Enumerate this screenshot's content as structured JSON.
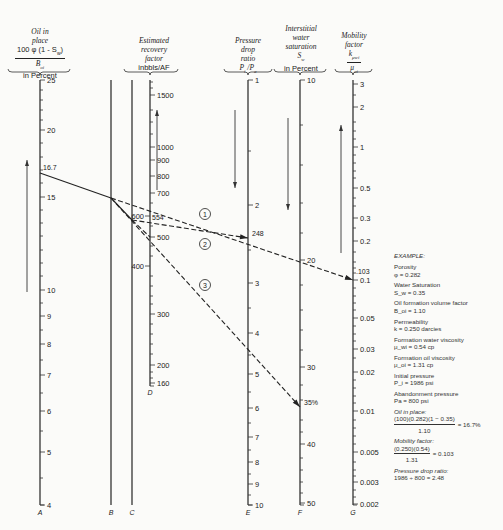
{
  "headers": {
    "A": {
      "lines": [
        "Oil in",
        "place"
      ],
      "numerator": "100 φ (1 - S_w)",
      "denominator": "B_oi",
      "unit": "in Percent"
    },
    "D": {
      "lines": [
        "Estimated",
        "recovery",
        "factor"
      ],
      "unit": "inbbls/AF"
    },
    "E": {
      "lines": [
        "Pressure",
        "drop",
        "ratio"
      ],
      "symbol": "P_i / P_a"
    },
    "F": {
      "lines": [
        "Interstitial",
        "water",
        "saturation"
      ],
      "symbol": "S_w",
      "unit": "in Percent"
    },
    "G": {
      "lines": [
        "Mobility",
        "factor"
      ],
      "numerator": "k_μwi",
      "denominator": "μ_oi"
    }
  },
  "example": {
    "title": "EXAMPLE:",
    "items": [
      {
        "label": "Porosity",
        "value": "φ = 0.282"
      },
      {
        "label": "Water Saturation",
        "value": "S_w = 0.35"
      },
      {
        "label": "Oil formation volume factor",
        "value": "B_oi = 1.10"
      },
      {
        "label": "Permeability",
        "value": "k = 0.250 darcies"
      },
      {
        "label": "Formation water viscosity",
        "value": "μ_wi = 0.54 cp"
      },
      {
        "label": "Formation oil viscosity",
        "value": "μ_oi = 1.31 cp"
      },
      {
        "label": "Initial pressure",
        "value": "P_i = 1986 psi"
      },
      {
        "label": "Abandonment pressure",
        "value": "Pa = 800 psi"
      }
    ],
    "oil_in_place": {
      "label": "Oil in place:",
      "numerator": "(100)(0.282)(1 − 0.35)",
      "denominator": "1.10",
      "result": "= 16.7%"
    },
    "mobility": {
      "label": "Mobility factor:",
      "numerator": "(0.250)(0.54)",
      "denominator": "1.31",
      "result": "= 0.103"
    },
    "pressure": {
      "label": "Pressure drop ratio:",
      "value": "1986 ÷ 800 = 2.48"
    }
  },
  "chart_data": {
    "type": "nomograph",
    "axes": [
      {
        "id": "A",
        "name": "Oil in place, 100φ(1-Sw)/Boi, in Percent",
        "x": 40,
        "y_top": 80,
        "y_bottom": 505,
        "ticks": [
          {
            "label": "25",
            "y": 80
          },
          {
            "label": "20",
            "y": 130
          },
          {
            "label": "15",
            "y": 197
          },
          {
            "label": "10",
            "y": 290
          },
          {
            "label": "9",
            "y": 316
          },
          {
            "label": "8",
            "y": 344
          },
          {
            "label": "7",
            "y": 375
          },
          {
            "label": "6",
            "y": 411
          },
          {
            "label": "5",
            "y": 452
          },
          {
            "label": "4",
            "y": 505
          }
        ],
        "minor_ys": [
          90,
          100,
          110,
          120,
          143,
          157,
          170,
          183,
          210,
          223,
          236,
          250,
          263,
          276,
          303,
          330,
          360,
          393,
          431,
          478
        ],
        "marked": {
          "label": "16.7",
          "y": 173
        }
      },
      {
        "id": "B",
        "name": "Turning line B",
        "x": 111,
        "y_top": 80,
        "y_bottom": 505
      },
      {
        "id": "C",
        "name": "Turning line C",
        "x": 132,
        "y_top": 80,
        "y_bottom": 505
      },
      {
        "id": "D",
        "name": "Estimated recovery factor, inbbls/AF",
        "x": 150,
        "y_top": 80,
        "y_bottom": 386,
        "ticks": [
          {
            "label": "1500",
            "y": 95,
            "side": "right"
          },
          {
            "label": "1000",
            "y": 147,
            "side": "right"
          },
          {
            "label": "900",
            "y": 160,
            "side": "right"
          },
          {
            "label": "800",
            "y": 176,
            "side": "right"
          },
          {
            "label": "700",
            "y": 193,
            "side": "right"
          },
          {
            "label": "600",
            "y": 216,
            "side": "left"
          },
          {
            "label": "500",
            "y": 237,
            "side": "right"
          },
          {
            "label": "400",
            "y": 266,
            "side": "left"
          },
          {
            "label": "300",
            "y": 314,
            "side": "right"
          },
          {
            "label": "200",
            "y": 365,
            "side": "right"
          },
          {
            "label": "160",
            "y": 383,
            "side": "right"
          }
        ],
        "minor_ys": [
          82,
          88,
          110,
          122,
          134,
          203,
          226,
          246,
          256,
          276,
          286,
          296,
          304,
          324,
          334,
          344,
          354,
          372,
          378
        ],
        "marked": {
          "label": "554",
          "y": 221
        }
      },
      {
        "id": "E",
        "name": "Pressure drop ratio, Pi/Pa",
        "x": 248,
        "y_top": 80,
        "y_bottom": 505,
        "ticks": [
          {
            "label": "1",
            "y": 80
          },
          {
            "label": "2",
            "y": 205
          },
          {
            "label": "3",
            "y": 283
          },
          {
            "label": "4",
            "y": 333
          },
          {
            "label": "5",
            "y": 374
          },
          {
            "label": "6",
            "y": 408
          },
          {
            "label": "7",
            "y": 437
          },
          {
            "label": "8",
            "y": 462
          },
          {
            "label": "9",
            "y": 484
          },
          {
            "label": "10",
            "y": 505
          }
        ],
        "minor_ys": [
          151,
          250,
          308,
          355,
          392,
          423,
          450,
          474,
          495
        ],
        "marked": {
          "label": "248",
          "y": 238
        }
      },
      {
        "id": "F",
        "name": "Interstitial water saturation, Sw in Percent",
        "x": 300,
        "y_top": 80,
        "y_bottom": 505,
        "ticks": [
          {
            "label": "10",
            "y": 80
          },
          {
            "label": "20",
            "y": 260
          },
          {
            "label": "30",
            "y": 367
          },
          {
            "label": "40",
            "y": 444
          },
          {
            "label": "50",
            "y": 503
          }
        ],
        "minor_ys": [
          125,
          165,
          203,
          233,
          285,
          310,
          330,
          350,
          385,
          400,
          420,
          432,
          458,
          470,
          482,
          493
        ],
        "marked": {
          "label": "35%",
          "y": 407
        }
      },
      {
        "id": "G",
        "name": "Mobility factor, kμwi/μoi",
        "x": 353,
        "y_top": 80,
        "y_bottom": 505,
        "ticks": [
          {
            "label": "3",
            "y": 84
          },
          {
            "label": "2",
            "y": 107
          },
          {
            "label": "1",
            "y": 147
          },
          {
            "label": "0.5",
            "y": 188
          },
          {
            "label": "0.3",
            "y": 218
          },
          {
            "label": "0.2",
            "y": 241
          },
          {
            "label": "0.1",
            "y": 280
          },
          {
            "label": "0.05",
            "y": 318
          },
          {
            "label": "0.03",
            "y": 349
          },
          {
            "label": "0.02",
            "y": 372
          },
          {
            "label": "0.01",
            "y": 411
          },
          {
            "label": "0.005",
            "y": 452
          },
          {
            "label": "0.003",
            "y": 482
          },
          {
            "label": "0.002",
            "y": 504
          }
        ],
        "minor_ys": [
          95,
          122,
          131,
          139,
          155,
          163,
          171,
          178,
          198,
          206,
          228,
          252,
          262,
          268,
          273,
          288,
          296,
          303,
          310,
          326,
          334,
          341,
          358,
          380,
          388,
          396,
          403,
          420,
          428,
          436,
          444,
          462,
          470,
          476,
          490,
          497
        ],
        "marked": {
          "label": ".103",
          "y": 272
        }
      }
    ],
    "example_lines": [
      {
        "id": "base",
        "style": "solid",
        "from": {
          "axis": "A",
          "value": "16.7"
        },
        "points": [
          [
            40,
            173
          ],
          [
            111,
            198
          ]
        ]
      },
      {
        "id": "base-to-C",
        "style": "solid",
        "points": [
          [
            111,
            198
          ],
          [
            132,
            220
          ]
        ]
      },
      {
        "id": "1",
        "label": "1",
        "style": "dashed",
        "points": [
          [
            111,
            198
          ],
          [
            353,
            280
          ]
        ],
        "circle": [
          205,
          214
        ]
      },
      {
        "id": "2",
        "label": "2",
        "style": "dashed",
        "points": [
          [
            132,
            220
          ],
          [
            248,
            238
          ]
        ],
        "circle": [
          205,
          244
        ],
        "arrow": true
      },
      {
        "id": "3",
        "label": "3",
        "style": "dashed",
        "points": [
          [
            111,
            198
          ],
          [
            300,
            407
          ]
        ],
        "circle": [
          205,
          285
        ],
        "arrow": true
      },
      {
        "id": "3-to-C",
        "style": "dashed",
        "points": [
          [
            132,
            220
          ],
          [
            150,
            237
          ]
        ]
      }
    ],
    "direction_arrows": [
      {
        "x": 27,
        "y1": 292,
        "y2": 160,
        "dir": "up"
      },
      {
        "x": 157,
        "y1": 190,
        "y2": 110,
        "dir": "up"
      },
      {
        "x": 235,
        "y1": 110,
        "y2": 188,
        "dir": "down"
      },
      {
        "x": 288,
        "y1": 118,
        "y2": 210,
        "dir": "down"
      },
      {
        "x": 341,
        "y1": 253,
        "y2": 125,
        "dir": "up"
      }
    ],
    "axis_letters": [
      {
        "label": "A",
        "x": 40,
        "y": 515
      },
      {
        "label": "B",
        "x": 111,
        "y": 515
      },
      {
        "label": "C",
        "x": 132,
        "y": 515
      },
      {
        "label": "D",
        "x": 150,
        "y": 395
      },
      {
        "label": "E",
        "x": 248,
        "y": 515
      },
      {
        "label": "F",
        "x": 300,
        "y": 515
      },
      {
        "label": "G",
        "x": 353,
        "y": 515
      }
    ],
    "xlabel": "",
    "ylabel": ""
  }
}
